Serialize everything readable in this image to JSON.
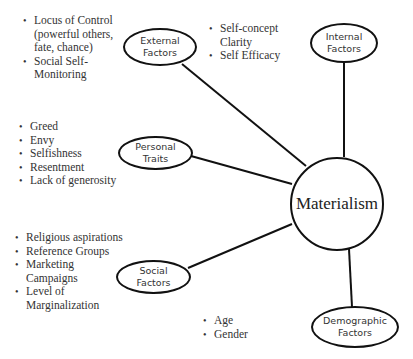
{
  "center": {
    "label": "Materialism"
  },
  "nodes": {
    "external": {
      "label_line1": "External",
      "label_line2": "Factors"
    },
    "internal": {
      "label_line1": "Internal",
      "label_line2": "Factors"
    },
    "personal": {
      "label_line1": "Personal",
      "label_line2": "Traits"
    },
    "social": {
      "label_line1": "Social",
      "label_line2": "Factors"
    },
    "demographic": {
      "label_line1": "Demographic",
      "label_line2": "Factors"
    }
  },
  "lists": {
    "external": [
      "Locus of Control (powerful others, fate, chance)",
      "Social Self-Monitoring"
    ],
    "internal": [
      "Self-concept Clarity",
      "Self Efficacy"
    ],
    "personal": [
      "Greed",
      "Envy",
      "Selfishness",
      "Resentment",
      "Lack of generosity"
    ],
    "social": [
      "Religious aspirations",
      "Reference Groups",
      "Marketing Campaigns",
      "Level of Marginalization"
    ],
    "demographic": [
      "Age",
      "Gender"
    ]
  },
  "colors": {
    "stroke": "#111111",
    "text": "#333333",
    "background": "#ffffff"
  }
}
